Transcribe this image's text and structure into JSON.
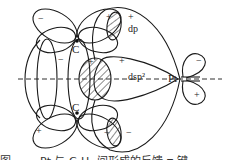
{
  "diagram": {
    "type": "orbital-bonding-diagram",
    "atoms": {
      "carbon_top": "C",
      "carbon_bottom": "C",
      "platinum": "Pt"
    },
    "orbital_labels": {
      "dp": "dp",
      "dsp2": "dsp²"
    },
    "signs": {
      "c_top_left_lobe": "−",
      "c_top_right_lobe_upper": "+",
      "c_top_inner_left": "−",
      "c_top_inner_right": "+",
      "hatched_center_plus": "+",
      "dp_plus": "+",
      "c_bottom_left_lobe": "+",
      "c_bottom_right_lobe": "−",
      "dp_lower_minus": "−",
      "pt_upper_lobe": "−",
      "pt_lower_lobe": "+"
    },
    "colors": {
      "line": "#1a1a1a",
      "background": "#ffffff"
    }
  },
  "caption": {
    "text": "图 ……  Pt 与 C₂H₄ 间形成的反馈 π 键"
  }
}
